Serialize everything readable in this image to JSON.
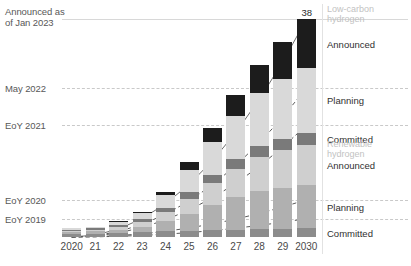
{
  "chart_data": {
    "type": "bar",
    "title": "",
    "subtitle": "",
    "xlabel": "",
    "ylabel": "",
    "stacked": true,
    "grid": true,
    "legend_position": "right",
    "ylim": [
      0,
      40
    ],
    "value_labels": {
      "2030": "38"
    },
    "categories": [
      "2020",
      "21",
      "22",
      "23",
      "24",
      "25",
      "26",
      "27",
      "28",
      "29",
      "2030"
    ],
    "series": [
      {
        "name": "Low-carbon hydrogen Committed",
        "color": "#8c8c8c",
        "values": [
          0.6,
          0.6,
          0.7,
          0.8,
          1.0,
          1.1,
          1.2,
          1.3,
          1.4,
          1.4,
          1.5
        ]
      },
      {
        "name": "Low-carbon hydrogen Planning",
        "color": "#b0b0b0",
        "values": [
          0.3,
          0.4,
          0.6,
          1.0,
          1.8,
          3.0,
          4.4,
          5.6,
          6.6,
          7.2,
          7.6
        ]
      },
      {
        "name": "Low-carbon hydrogen Announced",
        "color": "#cfcfcf",
        "values": [
          0.2,
          0.3,
          0.5,
          0.9,
          1.6,
          2.6,
          3.8,
          5.0,
          6.0,
          6.6,
          7.0
        ]
      },
      {
        "name": "Renewable hydrogen Committed",
        "color": "#7a7a7a",
        "values": [
          0.2,
          0.2,
          0.3,
          0.4,
          0.7,
          1.1,
          1.4,
          1.7,
          1.9,
          2.0,
          2.1
        ]
      },
      {
        "name": "Renewable hydrogen Planning",
        "color": "#d9d9d9",
        "values": [
          0.2,
          0.3,
          0.6,
          1.1,
          2.2,
          3.9,
          5.8,
          7.6,
          9.2,
          10.4,
          11.3
        ]
      },
      {
        "name": "Renewable hydrogen Announced",
        "color": "#1c1c1c",
        "values": [
          0.0,
          0.0,
          0.1,
          0.2,
          0.6,
          1.4,
          2.4,
          3.6,
          5.0,
          6.4,
          8.5
        ]
      }
    ],
    "reference_lines": [
      {
        "label": "Announced as\nof Jan 2023",
        "style": "solid",
        "value": 38.0
      },
      {
        "label": "May 2022",
        "style": "dashed",
        "value": 26.0
      },
      {
        "label": "EoY 2021",
        "style": "dashed",
        "value": 19.5
      },
      {
        "label": "EoY 2020",
        "style": "dashed",
        "value": 6.5
      },
      {
        "label": "EoY 2019",
        "style": "dashed",
        "value": 3.2
      }
    ],
    "trend_lines": [
      {
        "name": "Announced as of Jan 2023",
        "style": "solid",
        "endpoint": 38.0
      },
      {
        "name": "May 2022",
        "style": "dashed",
        "endpoint": 26.0
      },
      {
        "name": "EoY 2021",
        "style": "dashed",
        "endpoint": 19.5
      },
      {
        "name": "EoY 2020",
        "style": "dashed",
        "endpoint": 6.5
      },
      {
        "name": "EoY 2019",
        "style": "dashed",
        "endpoint": 3.2
      }
    ]
  },
  "annotations": [
    {
      "text": "Announced as\nof Jan 2023"
    },
    {
      "text": "May 2022"
    },
    {
      "text": "EoY 2021"
    },
    {
      "text": "EoY 2020"
    },
    {
      "text": "EoY 2019"
    }
  ],
  "legend": {
    "groups": [
      {
        "title": "Low-carbon\nhydrogen",
        "items": [
          {
            "label": "Announced",
            "color": "#1c1c1c"
          },
          {
            "label": "Planning",
            "color": "#d9d9d9"
          },
          {
            "label": "Committed",
            "color": "#7a7a7a"
          }
        ]
      },
      {
        "title": "Renewable\nhydrogen",
        "items": [
          {
            "label": "Announced",
            "color": "#cfcfcf"
          },
          {
            "label": "Planning",
            "color": "#b0b0b0"
          },
          {
            "label": "Committed",
            "color": "#8c8c8c"
          }
        ]
      }
    ]
  },
  "axis": {
    "x_ticks": [
      "2020",
      "21",
      "22",
      "23",
      "24",
      "25",
      "26",
      "27",
      "28",
      "29",
      "2030"
    ]
  },
  "labels": {
    "peak_value": "38"
  }
}
